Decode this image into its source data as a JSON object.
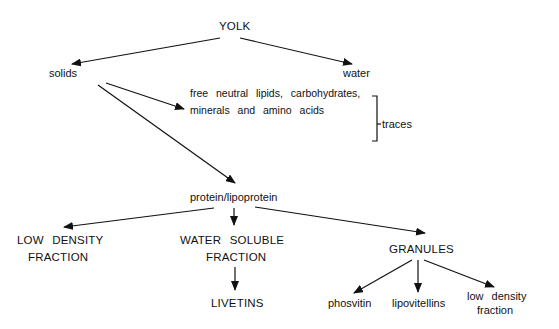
{
  "diagram": {
    "nodes": {
      "yolk": "YOLK",
      "solids": "solids",
      "water": "water",
      "traces_line1": "free neutral lipids, carbohydrates,",
      "traces_line2": "minerals and amino acids",
      "traces_label": "traces",
      "protein": "protein/lipoprotein",
      "ldf_line1": "LOW DENSITY",
      "ldf_line2": "FRACTION",
      "wsf_line1": "WATER SOLUBLE",
      "wsf_line2": "FRACTION",
      "livetins": "LIVETINS",
      "granules": "GRANULES",
      "phosvitin": "phosvitin",
      "lipovitellins": "lipovitellins",
      "gldf_line1": "low density",
      "gldf_line2": "fraction"
    },
    "edges": [
      {
        "from": "YOLK",
        "to": "solids"
      },
      {
        "from": "YOLK",
        "to": "water"
      },
      {
        "from": "solids",
        "to": "free neutral lipids, carbohydrates, minerals and amino acids"
      },
      {
        "from": "solids",
        "to": "protein/lipoprotein"
      },
      {
        "from": "protein/lipoprotein",
        "to": "LOW DENSITY FRACTION"
      },
      {
        "from": "protein/lipoprotein",
        "to": "WATER SOLUBLE FRACTION"
      },
      {
        "from": "protein/lipoprotein",
        "to": "GRANULES"
      },
      {
        "from": "WATER SOLUBLE FRACTION",
        "to": "LIVETINS"
      },
      {
        "from": "GRANULES",
        "to": "phosvitin"
      },
      {
        "from": "GRANULES",
        "to": "lipovitellins"
      },
      {
        "from": "GRANULES",
        "to": "low density fraction"
      }
    ],
    "colors": {
      "ink": "#111111",
      "background": "#ffffff"
    }
  }
}
